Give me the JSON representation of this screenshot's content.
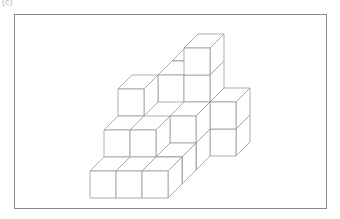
{
  "figure": {
    "panel_label": "(c)",
    "line_color": "#9a9a9a",
    "frame_color": "#8a8a8a"
  },
  "projection": {
    "origin": [
      90,
      198
    ],
    "size_x": 26,
    "size_y": 27,
    "depth_dx": 14,
    "depth_dy": -14
  },
  "cubes": [
    {
      "c": 0,
      "d": 0,
      "l": 0
    },
    {
      "c": 1,
      "d": 0,
      "l": 0
    },
    {
      "c": 2,
      "d": 0,
      "l": 0
    },
    {
      "c": 2,
      "d": 1,
      "l": 0
    },
    {
      "c": 2,
      "d": 2,
      "l": 0
    },
    {
      "c": 0,
      "d": 1,
      "l": 1
    },
    {
      "c": 1,
      "d": 1,
      "l": 1
    },
    {
      "c": 2,
      "d": 2,
      "l": 1
    },
    {
      "c": 3,
      "d": 3,
      "l": 0
    },
    {
      "c": 3,
      "d": 3,
      "l": 1
    },
    {
      "c": 0,
      "d": 2,
      "l": 2
    },
    {
      "c": 1,
      "d": 3,
      "l": 2
    },
    {
      "c": 2,
      "d": 3,
      "l": 2
    },
    {
      "c": 2,
      "d": 3,
      "l": 3
    },
    {
      "c": 1,
      "d": 4,
      "l": 2
    }
  ]
}
